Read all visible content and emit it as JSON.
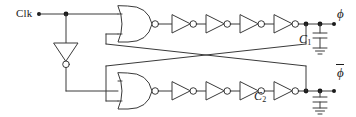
{
  "diagram": {
    "stroke_color": "#3a3a3a",
    "text_color": "#1a1a1a",
    "background": "#ffffff",
    "width": 356,
    "height": 117
  },
  "labels": {
    "clk": "Clk",
    "phi": "ϕ",
    "phi_bar": "ϕ",
    "c1_name": "C",
    "c1_sub": "1",
    "c2_name": "C",
    "c2_sub": "2"
  },
  "components": {
    "nor_gates": [
      {
        "name": "nor-gate-top",
        "inputs": [
          "Clk",
          "feedback-from-phi-bar"
        ],
        "output": "top-delay-chain"
      },
      {
        "name": "nor-gate-bottom",
        "inputs": [
          "Clk-inverted",
          "feedback-from-phi"
        ],
        "output": "bottom-delay-chain"
      }
    ],
    "clock_inverter": {
      "name": "clk-inverter",
      "orientation": "down"
    },
    "top_chain_inverters": 4,
    "bottom_chain_inverters": 4,
    "capacitors": [
      {
        "name": "capacitor-c1",
        "label": "C1",
        "node": "phi"
      },
      {
        "name": "capacitor-c2",
        "label": "C2",
        "node": "phi-bar"
      }
    ],
    "grounds": 2,
    "junction_dots": 6,
    "terminals": [
      "Clk",
      "phi",
      "phi-bar"
    ]
  }
}
